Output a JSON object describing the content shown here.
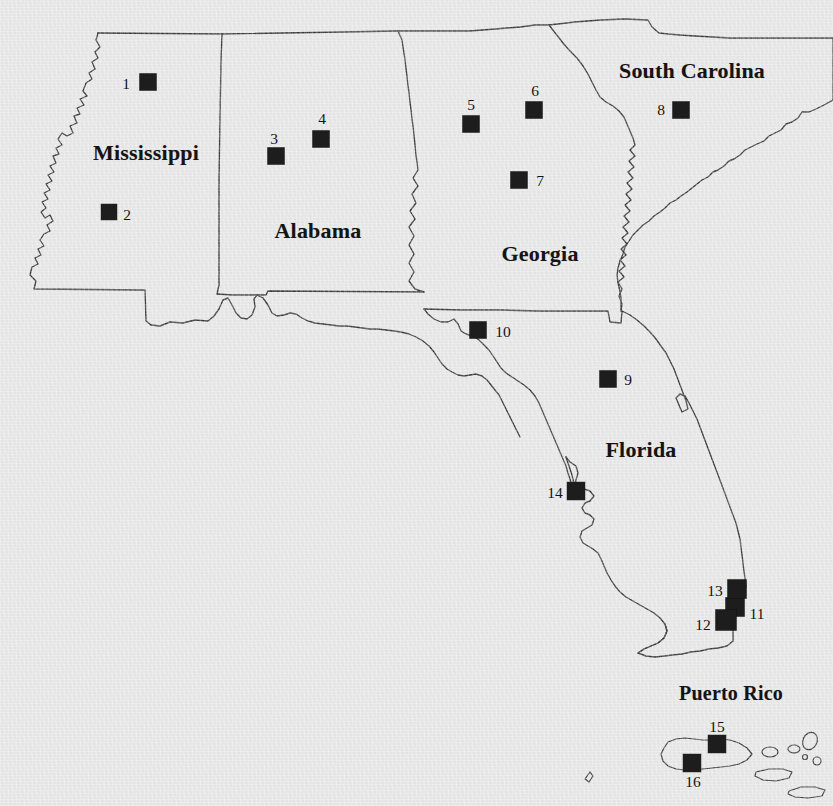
{
  "map": {
    "title": "Southeastern United States and Puerto Rico site location map",
    "background_color": "#e9e9e9",
    "outline_color": "#3c3c3c",
    "marker_color": "#1d1d1d",
    "label_color": "#141414",
    "width": 833,
    "height": 806
  },
  "state_labels": [
    {
      "name": "Mississippi",
      "text": "Mississippi",
      "x": 146,
      "y": 153,
      "size": 22
    },
    {
      "name": "Alabama",
      "text": "Alabama",
      "x": 318,
      "y": 231,
      "size": 22
    },
    {
      "name": "Georgia",
      "text": "Georgia",
      "x": 540,
      "y": 254,
      "size": 22
    },
    {
      "name": "South Carolina",
      "text": "South  Carolina",
      "x": 692,
      "y": 71,
      "size": 22
    },
    {
      "name": "Florida",
      "text": "Florida",
      "x": 641,
      "y": 450,
      "size": 22
    },
    {
      "name": "Puerto Rico",
      "text": "Puerto  Rico",
      "x": 731,
      "y": 693,
      "size": 20
    }
  ],
  "markers": [
    {
      "id": "1",
      "state": "Mississippi",
      "sx": 148,
      "sy": 82,
      "size": 17,
      "lx": 126,
      "ly": 84
    },
    {
      "id": "2",
      "state": "Mississippi",
      "sx": 109,
      "sy": 212,
      "size": 16,
      "lx": 127,
      "ly": 215
    },
    {
      "id": "3",
      "state": "Alabama",
      "sx": 276,
      "sy": 156,
      "size": 17,
      "lx": 274,
      "ly": 139
    },
    {
      "id": "4",
      "state": "Alabama",
      "sx": 321,
      "sy": 139,
      "size": 17,
      "lx": 322,
      "ly": 119
    },
    {
      "id": "5",
      "state": "Georgia",
      "sx": 471,
      "sy": 124,
      "size": 17,
      "lx": 471,
      "ly": 105
    },
    {
      "id": "6",
      "state": "Georgia",
      "sx": 534,
      "sy": 110,
      "size": 17,
      "lx": 535,
      "ly": 91
    },
    {
      "id": "7",
      "state": "Georgia",
      "sx": 519,
      "sy": 180,
      "size": 17,
      "lx": 540,
      "ly": 181
    },
    {
      "id": "8",
      "state": "South Carolina",
      "sx": 681,
      "sy": 110,
      "size": 17,
      "lx": 661,
      "ly": 110
    },
    {
      "id": "9",
      "state": "Florida",
      "sx": 608,
      "sy": 379,
      "size": 17,
      "lx": 628,
      "ly": 380
    },
    {
      "id": "10",
      "state": "Georgia",
      "sx": 478,
      "sy": 330,
      "size": 17,
      "lx": 503,
      "ly": 332
    },
    {
      "id": "11",
      "state": "Florida",
      "sx": 735,
      "sy": 607,
      "size": 19,
      "lx": 757,
      "ly": 614
    },
    {
      "id": "12",
      "state": "Florida",
      "sx": 726,
      "sy": 620,
      "size": 21,
      "lx": 703,
      "ly": 625
    },
    {
      "id": "13",
      "state": "Florida",
      "sx": 737,
      "sy": 589,
      "size": 19,
      "lx": 715,
      "ly": 591
    },
    {
      "id": "14",
      "state": "Florida",
      "sx": 576,
      "sy": 491,
      "size": 18,
      "lx": 555,
      "ly": 493
    },
    {
      "id": "15",
      "state": "Puerto Rico",
      "sx": 717,
      "sy": 744,
      "size": 18,
      "lx": 717,
      "ly": 727
    },
    {
      "id": "16",
      "state": "Puerto Rico",
      "sx": 692,
      "sy": 763,
      "size": 18,
      "lx": 693,
      "ly": 782
    }
  ],
  "shapes": {
    "mississippi_alabama": "M 98 33 L 96 40 L 100 47 L 95 52 L 98 58 L 92 62 L 95 69 L 89 73 L 92 79 L 86 83 L 83 91 L 87 96 L 80 99 L 84 105 L 77 108 L 80 114 L 74 116 L 77 123 L 70 126 L 73 133 L 67 136 L 62 133 L 58 139 L 62 145 L 56 148 L 59 154 L 53 156 L 56 163 L 50 166 L 54 172 L 48 175 L 52 181 L 46 184 L 50 190 L 44 193 L 48 199 L 42 202 L 46 208 L 41 212 L 45 218 L 50 215 L 53 221 L 47 225 L 50 231 L 44 234 L 40 240 L 44 246 L 38 249 L 41 255 L 35 258 L 38 264 L 32 267 L 30 275 L 36 281 L 34 289 L 145 290 L 146 321 L 151 325 L 160 326 L 170 322 L 183 323 L 195 320 L 208 321 L 214 316 L 218 309 L 217 294 L 219 285 L 219 240 L 219 180 L 220 120 L 221 60 L 222 34 L 98 33 Z",
    "alabama_east": "M 222 34 L 398 31 L 400 33 L 410 150 L 412 170 L 417 178 L 413 188 L 418 197 L 412 205 L 416 214 L 411 222 L 416 231 L 412 240 L 417 250 L 413 259 L 418 268 L 414 277 L 419 286 L 424 290 L 268 291 L 266 295 L 232 295 L 222 294",
    "georgia": "M 400 31 L 404 33 L 414 150 L 417 178 L 413 188 L 418 197 L 412 205 L 416 214 L 411 222 L 416 231 L 412 240 L 417 250 L 413 259 L 418 268 L 414 277 L 419 286 L 424 292 L 424 309 L 608 311 L 610 323 L 621 323 L 622 311 L 619 300 L 613 293 L 609 284 L 616 277 L 610 270 L 617 263 L 611 256 L 618 250 L 613 243 L 620 239 L 615 232 L 622 227 L 616 221 L 623 217 L 618 210 L 625 207 L 619 200 L 626 196 L 621 190 L 628 186 L 623 180 L 630 176 L 625 170 L 632 166 L 627 160 L 634 156 L 629 149 L 636 145 L 631 139 L 628 131 L 620 126 L 613 119 L 606 112 L 600 104 L 592 97 L 584 90 L 576 83 L 568 75 L 560 68 L 553 62 L 546 55 L 540 47 L 533 41 L 527 35 L 520 29 L 513 24 L 505 22 L 497 23 L 490 26 L 480 28 L 470 30 L 455 31 L 440 31 L 425 31 L 410 31 L 400 31 Z",
    "south_carolina": "M 513 24 L 520 29 L 527 35 L 533 41 L 540 47 L 546 55 L 553 62 L 560 68 L 568 75 L 576 83 L 584 90 L 592 97 L 600 104 L 606 112 L 613 119 L 620 126 L 628 131 L 631 139 L 636 145 L 629 149 L 634 156 L 627 160 L 632 166 L 625 170 L 630 176 L 623 180 L 628 186 L 621 190 L 626 196 L 619 200 L 625 207 L 618 210 L 623 217 L 616 221 L 622 227 L 615 232 L 620 239 L 613 243 L 618 250 L 611 256 L 617 263 L 610 270 L 616 277 L 609 284 L 613 293 L 619 300 L 622 311 L 632 309 L 640 302 L 646 295 L 653 288 L 656 281 L 663 278 L 668 271 L 675 267 L 679 260 L 687 256 L 691 249 L 698 246 L 701 239 L 707 233 L 713 229 L 716 222 L 722 218 L 727 212 L 733 208 L 737 201 L 744 198 L 748 191 L 755 187 L 760 181 L 766 177 L 770 170 L 777 166 L 781 160 L 787 156 L 791 150 L 797 146 L 802 140 L 808 137 L 813 131 L 820 127 L 826 122 L 830 117 L 833 113 L 833 106 L 824 106 L 810 105 L 795 105 L 780 104 L 765 104 L 750 103 L 735 103 L 720 102 L 705 102 L 700 94 L 693 86 L 686 80 L 678 76 L 670 73 L 660 70 L 650 66 L 640 62 L 630 58 L 620 54 L 610 50 L 600 45 L 590 40 L 580 36 L 570 33 L 560 31 L 550 29 L 540 27 L 530 25 L 520 24 L 513 24 Z",
    "gulf_coast_panhandle": "M 34 289 L 145 290 L 146 321 L 151 325 L 160 326 L 170 322 L 183 323 L 195 320 L 208 321 L 214 316 L 218 309 L 222 295 L 232 295 L 234 305 L 238 312 L 243 318 L 249 320 L 254 316 L 257 308 L 256 300 L 258 295 L 266 295 L 268 291 L 424 292 L 424 309 L 430 312 L 438 315 L 446 314 L 452 310 L 458 314 L 462 320 L 468 322 L 474 326 L 478 331 L 483 335 L 490 339 L 497 343 L 504 348 L 510 353 L 514 359 L 518 367 L 522 375 L 527 382 L 532 389 L 537 397 L 541 405 L 545 413 L 548 421 L 551 429 L 554 437 L 557 445 L 560 453 L 563 461 L 566 469 L 569 477 L 572 485 L 574 492 L 577 498 L 580 503 L 585 507 L 590 509 L 594 506 L 592 500 L 587 497 L 583 493 L 586 488 L 591 486 L 594 490 L 598 495 L 602 499 L 604 506 L 602 513 L 598 518 L 594 523 L 590 528 L 588 534 L 591 540 L 596 544 L 601 547 L 605 552 L 607 559 L 610 566 L 614 573 L 618 580 L 622 587 L 627 593 L 633 598 L 640 602 L 648 606 L 655 610 L 662 614 L 668 619 L 672 625 L 674 632 L 671 639 L 666 644 L 660 648 L 653 651 L 646 654 L 640 657 L 648 660 L 657 661 L 666 660 L 675 658 L 684 656 L 693 654 L 702 652 L 711 650 L 720 648 L 729 646 L 733 640 L 732 632 L 729 624 L 727 616 L 726 608 L 728 600 L 731 592 L 734 584 L 736 576 L 738 568 L 740 560 L 742 552 L 744 544 L 745 536 L 746 528 L 747 520 L 748 512 L 749 504 L 750 496 L 748 488 L 745 481 L 741 474 L 737 467 L 733 460 L 729 453 L 725 446 L 721 439 L 718 432 L 714 425 L 710 418 L 706 411 L 702 404 L 698 397 L 695 390 L 691 383 L 688 376 L 684 369 L 681 362 L 678 355 L 675 348 L 672 341 L 669 334 L 666 327 L 663 320 L 660 313 L 657 311 L 640 311 L 624 311 L 621 323 L 610 323 L 608 311 L 424 309",
    "florida_peninsula": "M 424 309 L 430 312 L 438 315 L 446 314 L 452 310 L 458 314 L 462 320 L 468 322 L 474 326 L 478 331 L 483 335 L 490 339 L 497 343 L 504 348 L 510 353 L 514 359 L 518 367 L 522 375 L 527 382 L 532 389 L 537 397 L 541 405 L 545 413 L 548 421 L 551 429 L 554 437 L 557 445 L 560 453 L 563 461 L 566 469 L 569 477 L 572 485 L 574 492",
    "puerto_rico_main": "M 664 748 L 668 742 L 675 739 L 684 738 L 693 739 L 702 740 L 711 740 L 720 739 L 729 740 L 738 743 L 746 748 L 752 754 L 748 760 L 740 764 L 731 766 L 722 767 L 713 768 L 704 769 L 695 770 L 686 770 L 677 769 L 669 766 L 663 761 L 661 754 Z",
    "islands": [
      "M 768 752 A 7 5 0 1 0 768 751 Z",
      "M 793 749 A 6 4 0 1 0 793 748 Z",
      "M 809 740 A 7 9 20 1 0 809 739 Z",
      "M 804 756 A 3 3 0 1 0 804 755 Z",
      "M 816 760 A 4 4 0 1 0 816 759 Z",
      "M 755 772 L 768 769 L 782 769 L 791 772 L 788 778 L 775 780 L 762 779 L 754 776 Z",
      "M 788 790 L 800 786 L 814 786 L 824 789 L 821 795 L 807 797 L 794 796 L 787 793 Z",
      "M 585 778 L 590 772 L 593 775 L 589 781 Z"
    ]
  }
}
